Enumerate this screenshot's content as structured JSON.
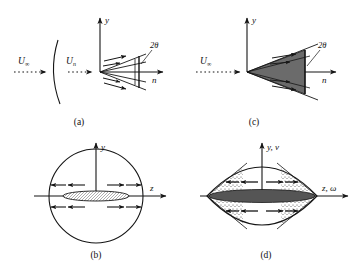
{
  "figure": {
    "title": "",
    "background_color": "#ffffff",
    "ink_color": "#151515",
    "panel_count": 4
  },
  "panels": [
    {
      "id": "a",
      "caption": "(a)",
      "view": "side-view-bow-shock",
      "axes": {
        "vertical_label": "y",
        "horizontal_label": "n"
      },
      "freestream_label": "U",
      "freestream_subscript": "∞",
      "normal_label": "U",
      "normal_subscript": "n",
      "angle_label": "2θ",
      "wedge_fill": "none",
      "arc_shown": true,
      "fan_arrow_count": 4
    },
    {
      "id": "b",
      "caption": "(b)",
      "view": "cross-section-circular",
      "axes": {
        "vertical_label": "y",
        "horizontal_label": "z"
      },
      "outline_shape": "circle",
      "core_shape": "ellipse",
      "core_fill": "#ffffff",
      "core_texture": "hatched",
      "arrow_rows": 2,
      "arrows_per_row": 4
    },
    {
      "id": "c",
      "caption": "(c)",
      "view": "side-view-collapsed-wedge",
      "axes": {
        "vertical_label": "y",
        "horizontal_label": "n"
      },
      "freestream_label": "U",
      "freestream_subscript": "∞",
      "angle_label": "2θ",
      "wedge_fill": "#6b6b6b",
      "arc_shown": false,
      "fan_arrow_count": 4
    },
    {
      "id": "d",
      "caption": "(d)",
      "view": "cross-section-lens",
      "axes": {
        "vertical_label": "y, v",
        "horizontal_label": "z, ω"
      },
      "outline_shape": "lens",
      "core_shape": "ellipse",
      "core_fill": "#555555",
      "core_texture": "solid",
      "side_texture": "stippled",
      "arrow_rows": 2,
      "arrows_per_row": 4
    }
  ],
  "symbols": {
    "infinity": "∞",
    "theta": "θ",
    "omega": "ω",
    "two_theta": "2θ"
  }
}
